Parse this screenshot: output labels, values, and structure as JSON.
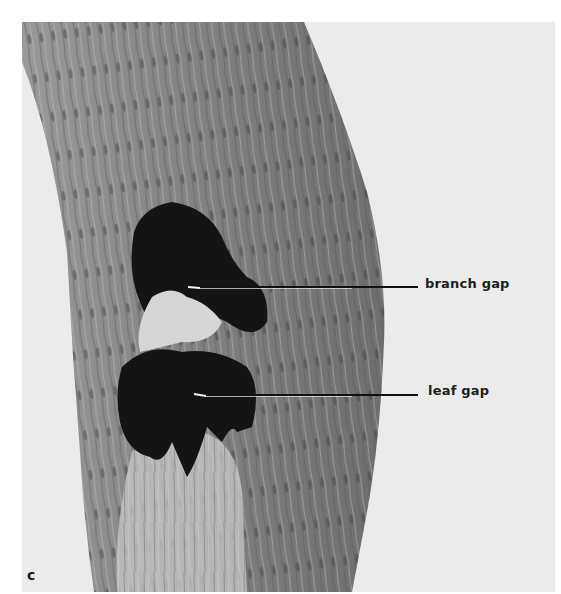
{
  "figure": {
    "panel_letter": "c",
    "annotations": [
      {
        "id": "branch-gap",
        "label": "branch gap"
      },
      {
        "id": "leaf-gap",
        "label": "leaf gap"
      }
    ],
    "colors": {
      "background": "#ebebeb",
      "stem_mid": "#8a8a8a",
      "gap_dark": "#141414",
      "leader_line": "#111111"
    }
  }
}
